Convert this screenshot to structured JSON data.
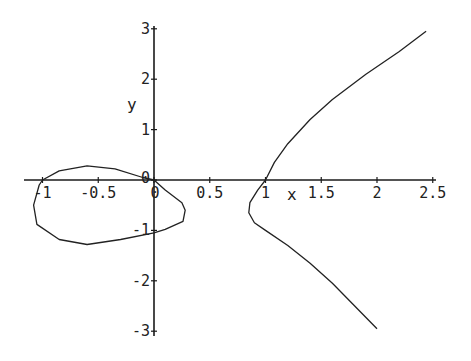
{
  "chart_data": {
    "type": "line",
    "title": "",
    "xlabel": "x",
    "ylabel": "y",
    "xlim": [
      -1.2,
      2.5
    ],
    "ylim": [
      -3,
      3
    ],
    "grid": false,
    "legend": null,
    "x_ticks": [
      "-1",
      "-0.5",
      "0",
      "0.5",
      "1",
      "1.5",
      "2",
      "2.5"
    ],
    "y_ticks": [
      "3",
      "2",
      "1",
      "0",
      "-1",
      "-2",
      "-3"
    ],
    "series": [
      {
        "name": "right-branch",
        "x": [
          2.44,
          2.2,
          1.9,
          1.6,
          1.4,
          1.2,
          1.08,
          1.0,
          0.93,
          0.86,
          0.85,
          0.9,
          1.0,
          1.2,
          1.4,
          1.6,
          1.8,
          2.0
        ],
        "y": [
          2.95,
          2.55,
          2.1,
          1.6,
          1.2,
          0.72,
          0.35,
          0.0,
          -0.2,
          -0.45,
          -0.65,
          -0.85,
          -1.0,
          -1.3,
          -1.65,
          -2.05,
          -2.5,
          -2.95
        ]
      },
      {
        "name": "left-oval",
        "x": [
          -1.0,
          -0.85,
          -0.6,
          -0.35,
          -0.1,
          0.0,
          0.1,
          0.25,
          0.28,
          0.26,
          0.1,
          0.0,
          -0.3,
          -0.6,
          -0.85,
          -1.05,
          -1.08,
          -1.03,
          -1.0
        ],
        "y": [
          0.0,
          0.18,
          0.28,
          0.22,
          0.05,
          0.0,
          -0.2,
          -0.45,
          -0.6,
          -0.82,
          -0.98,
          -1.05,
          -1.18,
          -1.28,
          -1.18,
          -0.88,
          -0.5,
          -0.1,
          0.0
        ]
      }
    ]
  },
  "labels": {
    "x_axis": "x",
    "y_axis": "y",
    "origin_x": "0",
    "origin_y": "0"
  }
}
